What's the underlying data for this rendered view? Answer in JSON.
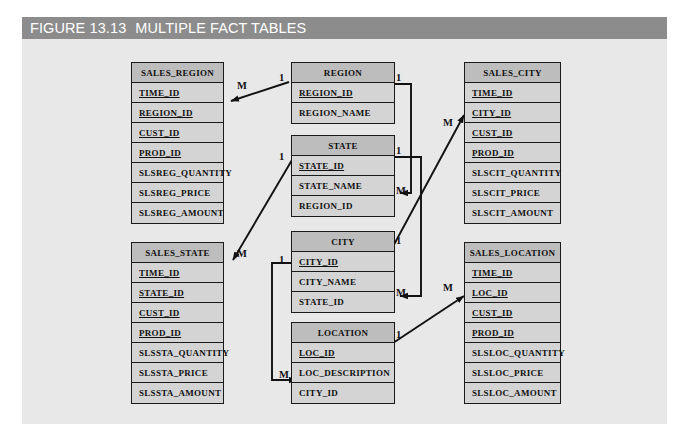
{
  "figure": {
    "number": "FIGURE 13.13",
    "title": "MULTIPLE FACT TABLES",
    "header_bg": "#8c8c8c",
    "panel_bg": "#e8e8e8",
    "entity_header_bg": "#bdbdbd",
    "entity_row_bg": "#d4d4d4",
    "line_color": "#111111"
  },
  "entities": [
    {
      "name": "sales-region",
      "header": "SALES_REGION",
      "rows": [
        {
          "label": "TIME_ID",
          "pk": true
        },
        {
          "label": "REGION_ID",
          "pk": true
        },
        {
          "label": "CUST_ID",
          "pk": true
        },
        {
          "label": "PROD_ID",
          "pk": true
        },
        {
          "label": "SLSREG_QUANTITY",
          "pk": false
        },
        {
          "label": "SLSREG_PRICE",
          "pk": false
        },
        {
          "label": "SLSREG_AMOUNT",
          "pk": false
        }
      ]
    },
    {
      "name": "region",
      "header": "REGION",
      "rows": [
        {
          "label": "REGION_ID",
          "pk": true
        },
        {
          "label": "REGION_NAME",
          "pk": false
        }
      ]
    },
    {
      "name": "sales-city",
      "header": "SALES_CITY",
      "rows": [
        {
          "label": "TIME_ID",
          "pk": true
        },
        {
          "label": "CITY_ID",
          "pk": true
        },
        {
          "label": "CUST_ID",
          "pk": true
        },
        {
          "label": "PROD_ID",
          "pk": true
        },
        {
          "label": "SLSCIT_QUANTITY",
          "pk": false
        },
        {
          "label": "SLSCIT_PRICE",
          "pk": false
        },
        {
          "label": "SLSCIT_AMOUNT",
          "pk": false
        }
      ]
    },
    {
      "name": "state",
      "header": "STATE",
      "rows": [
        {
          "label": "STATE_ID",
          "pk": true
        },
        {
          "label": "STATE_NAME",
          "pk": false
        },
        {
          "label": "REGION_ID",
          "pk": false
        }
      ]
    },
    {
      "name": "sales-state",
      "header": "SALES_STATE",
      "rows": [
        {
          "label": "TIME_ID",
          "pk": true
        },
        {
          "label": "STATE_ID",
          "pk": true
        },
        {
          "label": "CUST_ID",
          "pk": true
        },
        {
          "label": "PROD_ID",
          "pk": true
        },
        {
          "label": "SLSSTA_QUANTITY",
          "pk": false
        },
        {
          "label": "SLSSTA_PRICE",
          "pk": false
        },
        {
          "label": "SLSSTA_AMOUNT",
          "pk": false
        }
      ]
    },
    {
      "name": "city",
      "header": "CITY",
      "rows": [
        {
          "label": "CITY_ID",
          "pk": true
        },
        {
          "label": "CITY_NAME",
          "pk": false
        },
        {
          "label": "STATE_ID",
          "pk": false
        }
      ]
    },
    {
      "name": "location",
      "header": "LOCATION",
      "rows": [
        {
          "label": "LOC_ID",
          "pk": true
        },
        {
          "label": "LOC_DESCRIPTION",
          "pk": false
        },
        {
          "label": "CITY_ID",
          "pk": false
        }
      ]
    },
    {
      "name": "sales-location",
      "header": "SALES_LOCATION",
      "rows": [
        {
          "label": "TIME_ID",
          "pk": true
        },
        {
          "label": "LOC_ID",
          "pk": true
        },
        {
          "label": "CUST_ID",
          "pk": true
        },
        {
          "label": "PROD_ID",
          "pk": true
        },
        {
          "label": "SLSLOC_QUANTITY",
          "pk": false
        },
        {
          "label": "SLSLOC_PRICE",
          "pk": false
        },
        {
          "label": "SLSLOC_AMOUNT",
          "pk": false
        }
      ]
    }
  ],
  "cardinalities": [
    {
      "name": "region-to-sales-region-many",
      "text": "M",
      "x": 237,
      "y": 81
    },
    {
      "name": "region-one",
      "text": "1",
      "x": 279,
      "y": 73
    },
    {
      "name": "region-right-one",
      "text": "1",
      "x": 396,
      "y": 73
    },
    {
      "name": "state-left-one",
      "text": "1",
      "x": 279,
      "y": 152
    },
    {
      "name": "state-right-one",
      "text": "1",
      "x": 396,
      "y": 146
    },
    {
      "name": "state-region-many",
      "text": "M",
      "x": 396,
      "y": 186
    },
    {
      "name": "sales-city-many",
      "text": "M",
      "x": 443,
      "y": 118
    },
    {
      "name": "sales-state-many",
      "text": "M",
      "x": 237,
      "y": 249
    },
    {
      "name": "city-left-one",
      "text": "1",
      "x": 279,
      "y": 255
    },
    {
      "name": "city-right-one",
      "text": "1",
      "x": 396,
      "y": 236
    },
    {
      "name": "city-state-many",
      "text": "M",
      "x": 396,
      "y": 288
    },
    {
      "name": "location-right-one",
      "text": "1",
      "x": 396,
      "y": 330
    },
    {
      "name": "location-city-many",
      "text": "M",
      "x": 279,
      "y": 370
    },
    {
      "name": "sales-location-many",
      "text": "M",
      "x": 443,
      "y": 283
    }
  ]
}
